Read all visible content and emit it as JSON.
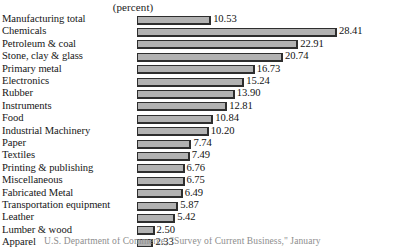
{
  "header": {
    "unit_label": "(percent)"
  },
  "footer": {
    "source_note": "U.S. Department of Commerce, \"Survey of Current Business,\" January"
  },
  "style": {
    "bar_fill": "#b2b2b2",
    "bar_border": "#2e2e2e",
    "text_color": "#161616",
    "background": "#ffffff"
  },
  "chart_data": {
    "type": "bar",
    "orientation": "horizontal",
    "title": "",
    "subtitle": "",
    "xlabel": "(percent)",
    "ylabel": "",
    "grid": false,
    "legend": false,
    "xlim": [
      0,
      28.41
    ],
    "value_format": "2-decimal",
    "categories": [
      "Manufacturing total",
      "Chemicals",
      "Petroleum & coal",
      "Stone, clay & glass",
      "Primary metal",
      "Electronics",
      "Rubber",
      "Instruments",
      "Food",
      "Industrial Machinery",
      "Paper",
      "Textiles",
      "Printing & publishing",
      "Miscellaneous",
      "Fabricated Metal",
      "Transportation equipment",
      "Leather",
      "Lumber & wood",
      "Apparel"
    ],
    "values": [
      10.53,
      28.41,
      22.91,
      20.74,
      16.73,
      15.24,
      13.9,
      12.81,
      10.84,
      10.2,
      7.74,
      7.49,
      6.76,
      6.75,
      6.49,
      5.87,
      5.42,
      2.5,
      2.33
    ],
    "value_labels": [
      "10.53",
      "28.41",
      "22.91",
      "20.74",
      "16.73",
      "15.24",
      "13.90",
      "12.81",
      "10.84",
      "10.20",
      "7.74",
      "7.49",
      "6.76",
      "6.75",
      "6.49",
      "5.87",
      "5.42",
      "2.50",
      "2.33"
    ]
  }
}
